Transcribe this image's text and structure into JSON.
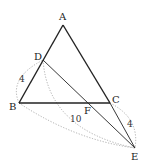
{
  "diagram": {
    "type": "geometry-triangle",
    "points": {
      "A": {
        "label": "A",
        "x": 63,
        "y": 25
      },
      "B": {
        "label": "B",
        "x": 19,
        "y": 103
      },
      "C": {
        "label": "C",
        "x": 110,
        "y": 103
      },
      "D": {
        "label": "D",
        "x": 43,
        "y": 60
      },
      "E": {
        "label": "E",
        "x": 135,
        "y": 148
      },
      "F": {
        "label": "F",
        "x": 89,
        "y": 103
      }
    },
    "measures": {
      "BD": "4",
      "BE": "10",
      "CE": "4"
    },
    "colors": {
      "stroke": "#222222",
      "dotted": "#999999",
      "text": "#222222"
    }
  }
}
